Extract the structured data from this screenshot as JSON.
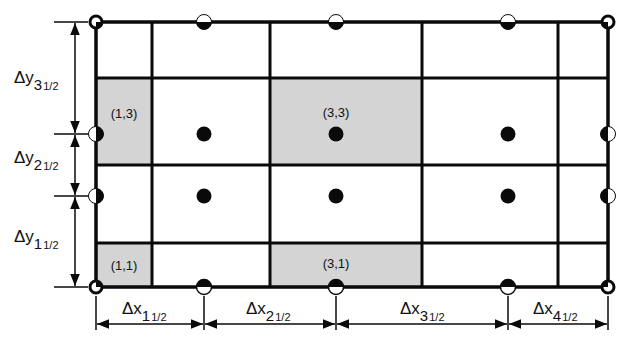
{
  "diagram": {
    "type": "staggered-grid-control-volumes",
    "colors": {
      "line": "#0a0a0a",
      "shade": "#d4d4d4",
      "background": "#ffffff"
    },
    "shaded_cells": [
      {
        "label": "(1,3)"
      },
      {
        "label": "(3,3)"
      },
      {
        "label": "(1,1)"
      },
      {
        "label": "(3,1)"
      }
    ],
    "dy_labels": [
      {
        "delta": "Δy",
        "index": "3",
        "fraction": "1/2"
      },
      {
        "delta": "Δy",
        "index": "2",
        "fraction": "1/2"
      },
      {
        "delta": "Δy",
        "index": "1",
        "fraction": "1/2"
      }
    ],
    "dx_labels": [
      {
        "delta": "Δx",
        "index": "1",
        "fraction": "1/2"
      },
      {
        "delta": "Δx",
        "index": "2",
        "fraction": "1/2"
      },
      {
        "delta": "Δx",
        "index": "3",
        "fraction": "1/2"
      },
      {
        "delta": "Δx",
        "index": "4",
        "fraction": "1/2"
      }
    ],
    "node_legend": {
      "interior": "filled-circle",
      "boundary_edge": "half-filled-circle",
      "corner": "ring-with-quarter"
    }
  }
}
